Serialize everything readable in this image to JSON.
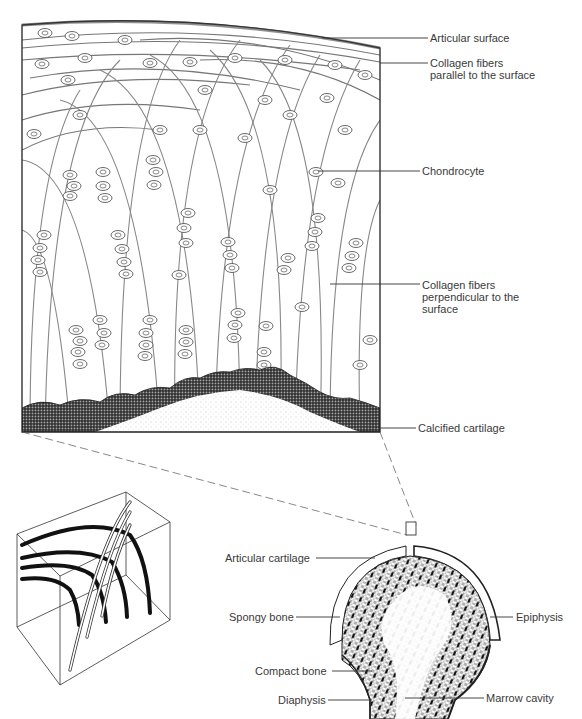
{
  "figure": {
    "main_panel": {
      "description": "Enlarged section of articular cartilage showing collagen fiber arches and chondrocytes",
      "labels": {
        "articular_surface": "Articular surface",
        "collagen_parallel": "Collagen fibers parallel to the surface",
        "chondrocyte": "Chondrocyte",
        "collagen_perpendicular": "Collagen fibers perpendicular to the surface",
        "calcified_cartilage": "Calcified cartilage"
      }
    },
    "bone_panel": {
      "description": "Longitudinal section of the end of a long bone",
      "labels": {
        "articular_cartilage": "Articular cartilage",
        "spongy_bone": "Spongy bone",
        "epiphysis": "Epiphysis",
        "compact_bone": "Compact bone",
        "diaphysis": "Diaphysis",
        "marrow_cavity": "Marrow cavity"
      }
    },
    "block_panel": {
      "description": "3D schematic block of arching collagen fibers"
    },
    "colors": {
      "ink": "#2a2a2a",
      "label_text": "#3a3a3a",
      "background": "#ffffff"
    }
  }
}
